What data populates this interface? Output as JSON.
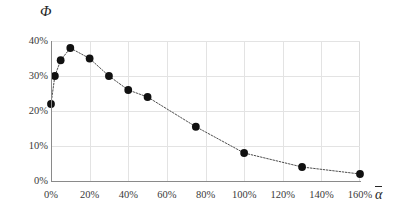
{
  "chart_data": {
    "type": "line",
    "title": "",
    "subtitle": "",
    "xlabel": "ᾱ",
    "ylabel": "Φ",
    "xlim": [
      0,
      160
    ],
    "ylim": [
      0,
      40
    ],
    "grid": true,
    "legend": false,
    "x_tick_labels": [
      "0%",
      "20%",
      "40%",
      "60%",
      "80%",
      "100%",
      "120%",
      "140%",
      "160%"
    ],
    "x_ticks": [
      0,
      20,
      40,
      60,
      80,
      100,
      120,
      140,
      160
    ],
    "y_tick_labels": [
      "0%",
      "10%",
      "20%",
      "30%",
      "40%"
    ],
    "y_ticks": [
      0,
      10,
      20,
      30,
      40
    ],
    "marker": "filled-circle",
    "line_style": "dotted",
    "series": [
      {
        "name": "",
        "x": [
          0,
          2,
          5,
          10,
          20,
          30,
          40,
          50,
          75,
          100,
          130,
          160
        ],
        "values": [
          22,
          30,
          34.5,
          38,
          35,
          30,
          26,
          24,
          15.5,
          8,
          4,
          2
        ]
      }
    ]
  },
  "axes": {
    "y_title": "Φ",
    "x_title_base": "α"
  },
  "colors": {
    "axis": "#8a8a8a",
    "grid": "#e3e3e3",
    "marker": "#111111",
    "line": "#4d4d4d",
    "text": "#3a3a3a"
  }
}
